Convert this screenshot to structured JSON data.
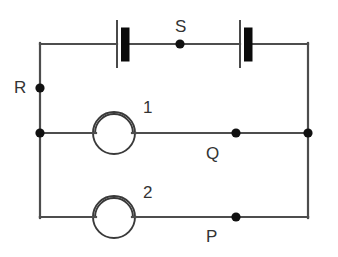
{
  "figure": {
    "background_color": "#ffffff",
    "wire_color": "#4d4d4d",
    "node_color": "#111111",
    "cell_plate_color": "#0b0b0b"
  },
  "labels": {
    "R": "R",
    "S": "S",
    "Q": "Q",
    "P": "P",
    "lamp1": "1",
    "lamp2": "2"
  },
  "components": [
    {
      "id": "cell-left",
      "kind": "battery-cell",
      "branch": "top-rail",
      "label": ""
    },
    {
      "id": "cell-right",
      "kind": "battery-cell",
      "branch": "top-rail",
      "label": ""
    },
    {
      "id": "lamp-1",
      "kind": "lamp",
      "branch": "middle-rail",
      "label": "1"
    },
    {
      "id": "lamp-2",
      "kind": "lamp",
      "branch": "bottom-rail",
      "label": "2"
    }
  ],
  "nodes": [
    {
      "id": "node-R",
      "label": "R",
      "branch": "left-rail"
    },
    {
      "id": "node-S",
      "label": "S",
      "branch": "top-rail"
    },
    {
      "id": "node-Q",
      "label": "Q",
      "branch": "middle-rail"
    },
    {
      "id": "node-P",
      "label": "P",
      "branch": "bottom-rail"
    },
    {
      "id": "node-left-middle",
      "label": "",
      "branch": "left-rail"
    },
    {
      "id": "node-right-middle",
      "label": "",
      "branch": "right-rail"
    }
  ]
}
